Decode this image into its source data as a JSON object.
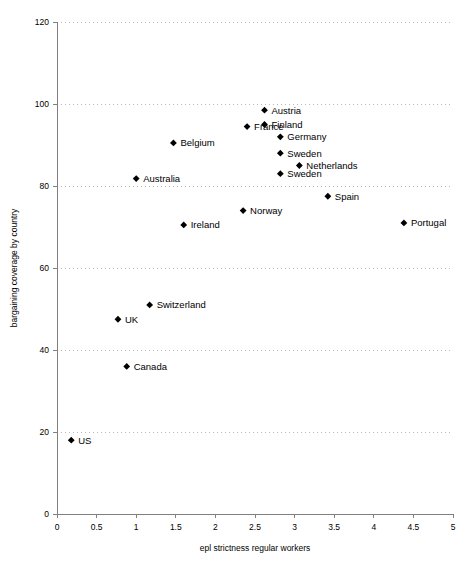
{
  "chart_data": {
    "type": "scatter",
    "title": "",
    "xlabel": "epl strictness regular workers",
    "ylabel": "bargaining coverage by country",
    "xlim": [
      0,
      5
    ],
    "ylim": [
      0,
      120
    ],
    "xticks": [
      "0",
      "0.5",
      "1",
      "1.5",
      "2",
      "2.5",
      "3",
      "3.5",
      "4",
      "4.5",
      "5"
    ],
    "xtick_values": [
      0,
      0.5,
      1,
      1.5,
      2,
      2.5,
      3,
      3.5,
      4,
      4.5,
      5
    ],
    "yticks": [
      "0",
      "20",
      "40",
      "60",
      "80",
      "100",
      "120"
    ],
    "ytick_values": [
      0,
      20,
      40,
      60,
      80,
      100,
      120
    ],
    "grid": "horizontal-dotted",
    "legend": "none",
    "marker": "filled-diamond",
    "marker_color": "#000000",
    "points": [
      {
        "label": "US",
        "x": 0.18,
        "y": 18,
        "label_side": "right"
      },
      {
        "label": "UK",
        "x": 0.77,
        "y": 47.5,
        "label_side": "right"
      },
      {
        "label": "Canada",
        "x": 0.88,
        "y": 36,
        "label_side": "right"
      },
      {
        "label": "Australia",
        "x": 1.0,
        "y": 81.8,
        "label_side": "right"
      },
      {
        "label": "Switzerland",
        "x": 1.17,
        "y": 51,
        "label_side": "right"
      },
      {
        "label": "Belgium",
        "x": 1.47,
        "y": 90.5,
        "label_side": "right"
      },
      {
        "label": "Ireland",
        "x": 1.6,
        "y": 70.5,
        "label_side": "right"
      },
      {
        "label": "Norway",
        "x": 2.35,
        "y": 74,
        "label_side": "right"
      },
      {
        "label": "France",
        "x": 2.4,
        "y": 94.5,
        "label_side": "right"
      },
      {
        "label": "Austria",
        "x": 2.62,
        "y": 98.5,
        "label_side": "right"
      },
      {
        "label": "Finland",
        "x": 2.62,
        "y": 95,
        "label_side": "right"
      },
      {
        "label": "Germany",
        "x": 2.82,
        "y": 92,
        "label_side": "right"
      },
      {
        "label": "Sweden",
        "x": 2.82,
        "y": 88,
        "label_side": "right"
      },
      {
        "label": "Sweden",
        "x": 2.82,
        "y": 83,
        "label_side": "right"
      },
      {
        "label": "Netherlands",
        "x": 3.06,
        "y": 85,
        "label_side": "right"
      },
      {
        "label": "Spain",
        "x": 3.42,
        "y": 77.5,
        "label_side": "right"
      },
      {
        "label": "Portugal",
        "x": 4.38,
        "y": 71,
        "label_side": "right"
      }
    ]
  }
}
